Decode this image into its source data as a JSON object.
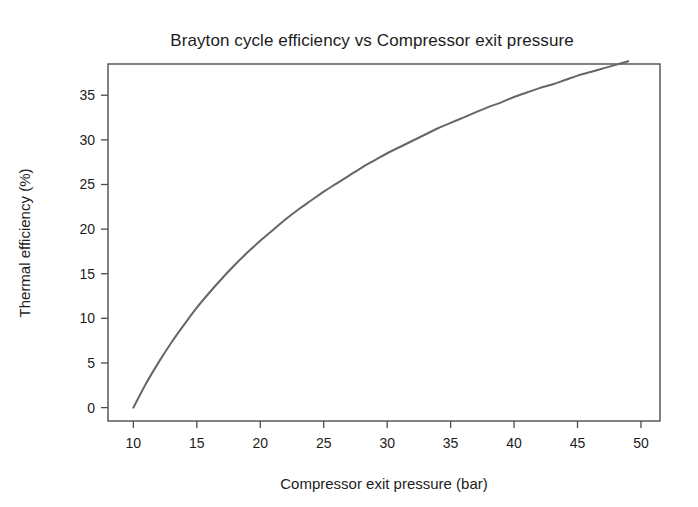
{
  "figure": {
    "background_color": "#ffffff",
    "width": 698,
    "height": 507
  },
  "chart_data": {
    "type": "line",
    "title": "Brayton cycle efficiency vs Compressor exit pressure",
    "xlabel": "Compressor exit pressure (bar)",
    "ylabel": "Thermal efficiency (%)",
    "xlim": [
      8.0,
      51.5
    ],
    "ylim": [
      -1.5,
      38.5
    ],
    "xticks": [
      10,
      15,
      20,
      25,
      30,
      35,
      40,
      45,
      50
    ],
    "xtick_labels": [
      "10",
      "15",
      "20",
      "25",
      "30",
      "35",
      "40",
      "45",
      "50"
    ],
    "yticks": [
      0,
      5,
      10,
      15,
      20,
      25,
      30,
      35
    ],
    "ytick_labels": [
      "0",
      "5",
      "10",
      "15",
      "20",
      "25",
      "30",
      "35"
    ],
    "grid": false,
    "legend": false,
    "legend_position": "none",
    "line_color": "#666666",
    "line_width": 2.0,
    "series": [
      {
        "name": "Thermal efficiency",
        "x": [
          10,
          11,
          12,
          13,
          14,
          15,
          16,
          17,
          18,
          19,
          20,
          21,
          22,
          23,
          24,
          25,
          26,
          27,
          28,
          29,
          30,
          31,
          32,
          33,
          34,
          35,
          36,
          37,
          38,
          39,
          40,
          41,
          42,
          43,
          44,
          45,
          46,
          47,
          48,
          49
        ],
        "y": [
          0.0,
          2.7,
          5.1,
          7.3,
          9.3,
          11.2,
          12.9,
          14.5,
          16.0,
          17.4,
          18.7,
          19.9,
          21.1,
          22.2,
          23.2,
          24.2,
          25.1,
          26.0,
          26.9,
          27.7,
          28.5,
          29.2,
          29.9,
          30.6,
          31.3,
          31.9,
          32.5,
          33.1,
          33.7,
          34.2,
          34.8,
          35.3,
          35.8,
          36.2,
          36.7,
          37.2,
          37.6,
          38.0,
          38.4,
          38.8
        ]
      }
    ],
    "annotations": []
  }
}
